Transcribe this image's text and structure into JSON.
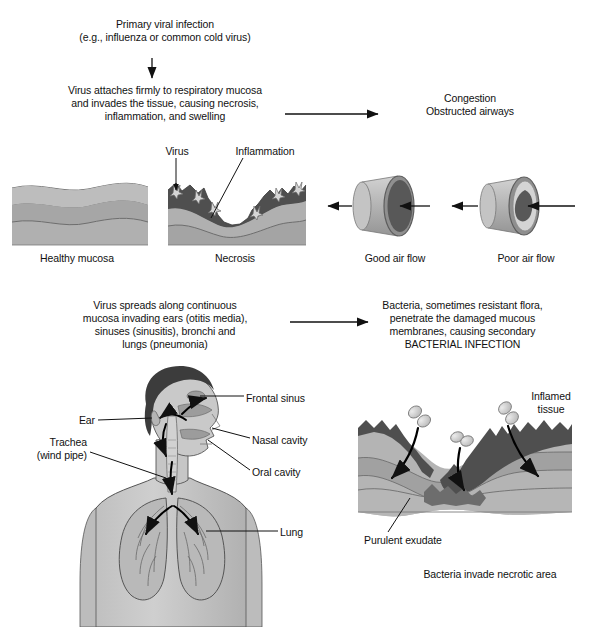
{
  "figure": {
    "width": 593,
    "height": 627,
    "background": "#ffffff"
  },
  "flow": {
    "step1": "Primary viral infection\n(e.g., influenza or common cold virus)",
    "step2": "Virus attaches firmly to respiratory mucosa\nand invades the tissue, causing necrosis,\ninflammation, and swelling",
    "step2_result": "Congestion\nObstructed airways",
    "step3": "Virus spreads along continuous\nmucosa invading ears (otitis media),\nsinuses (sinusitis), bronchi and\nlungs (pneumonia)",
    "step3_result": "Bacteria, sometimes resistant flora,\npenetrate the damaged mucous\nmembranes, causing secondary\nBACTERIAL INFECTION"
  },
  "mucosa": {
    "virus_label": "Virus",
    "inflammation_label": "Inflammation",
    "healthy_caption": "Healthy mucosa",
    "necrosis_caption": "Necrosis"
  },
  "airway": {
    "good_caption": "Good air flow",
    "poor_caption": "Poor air flow"
  },
  "anatomy": {
    "ear": "Ear",
    "trachea": "Trachea\n(wind pipe)",
    "frontal_sinus": "Frontal sinus",
    "nasal_cavity": "Nasal cavity",
    "oral_cavity": "Oral cavity",
    "lung": "Lung"
  },
  "bacteria_panel": {
    "inflamed_tissue": "Inflamed\ntissue",
    "purulent_exudate": "Purulent exudate",
    "caption": "Bacteria invade necrotic area"
  },
  "colors": {
    "ink": "#111111",
    "tissue_light": "#c9c9c9",
    "tissue_mid": "#ababab",
    "tissue_dark": "#9a9a9a",
    "necrotic": "#4d4d4d",
    "necrotic_light": "#6f6f6f",
    "skin": "#c3c3c3",
    "skin_shade": "#a9a9a9",
    "hair": "#3c3c3c",
    "lumen": "#5a5a5a",
    "cell_pale": "#d8d8d8"
  }
}
